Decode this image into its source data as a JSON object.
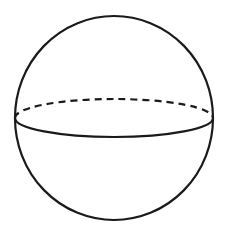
{
  "diagram": {
    "shape": "sphere",
    "stroke_color": "#1a1a1a",
    "background": "#ffffff",
    "outline": {
      "cx": 114,
      "cy": 118,
      "rx": 99,
      "ry": 102
    },
    "equator": {
      "cx": 114,
      "cy": 118,
      "rx": 99,
      "ry": 19,
      "front": "solid",
      "back": "dashed"
    }
  }
}
